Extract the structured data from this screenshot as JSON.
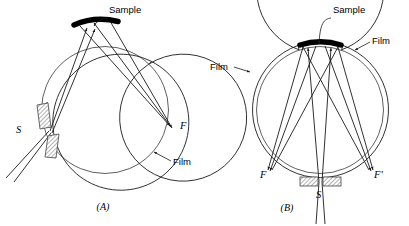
{
  "figure": {
    "background": "#ffffff",
    "ink_color": "#1a1a1a",
    "sample_color": "#000000",
    "hatch_color": "#555555",
    "width": 409,
    "height": 226
  },
  "panels": [
    {
      "id": "A",
      "caption": "(A)",
      "caption_pos": {
        "x": 103,
        "y": 210
      },
      "circle": {
        "cx": 105,
        "cy": 110,
        "r_outer": 68,
        "r_inner": 63.5
      },
      "labels": {
        "sample": "Sample",
        "source": "S",
        "focus": "F",
        "film": "Film"
      },
      "label_pos": {
        "sample": {
          "x": 109,
          "y": 13
        },
        "source": {
          "x": 16,
          "y": 133
        },
        "focus": {
          "x": 180,
          "y": 129
        },
        "film": {
          "x": 173,
          "y": 165
        }
      }
    },
    {
      "id": "B",
      "caption": "(B)",
      "caption_pos": {
        "x": 287,
        "y": 211
      },
      "circle": {
        "cx": 320,
        "cy": 110,
        "r_outer": 68,
        "r_inner": 63.5
      },
      "labels": {
        "sample": "Sample",
        "source": "S",
        "focus_left": "F",
        "focus_right": "F'",
        "film_left": "Film",
        "film_right": "Film"
      },
      "label_pos": {
        "sample": {
          "x": 333,
          "y": 13
        },
        "source": {
          "x": 317,
          "y": 196
        },
        "focus_left": {
          "x": 262,
          "y": 176
        },
        "focus_right": {
          "x": 374,
          "y": 176
        },
        "film_left": {
          "x": 212,
          "y": 70
        },
        "film_right": {
          "x": 372,
          "y": 44
        }
      }
    }
  ]
}
